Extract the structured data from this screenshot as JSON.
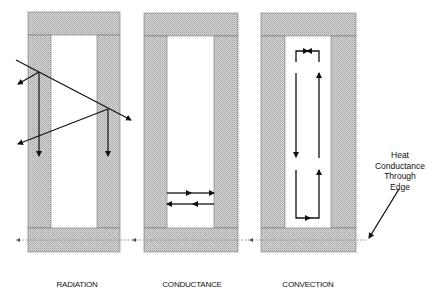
{
  "diagram": {
    "panels": [
      {
        "id": "radiation",
        "label": "RADIATION",
        "x": 28,
        "width": 92
      },
      {
        "id": "conductance",
        "label": "CONDUCTANCE",
        "x": 144,
        "width": 94
      },
      {
        "id": "convection",
        "label": "CONVECTION",
        "x": 261,
        "width": 95
      }
    ],
    "annotation": {
      "lines": [
        "Heat",
        "Conductance",
        "Through",
        "Edge"
      ]
    },
    "colors": {
      "wall_fill": "#c8c8c8",
      "wall_stroke": "#777777",
      "arrow": "#111111",
      "dashed": "#888888"
    }
  }
}
